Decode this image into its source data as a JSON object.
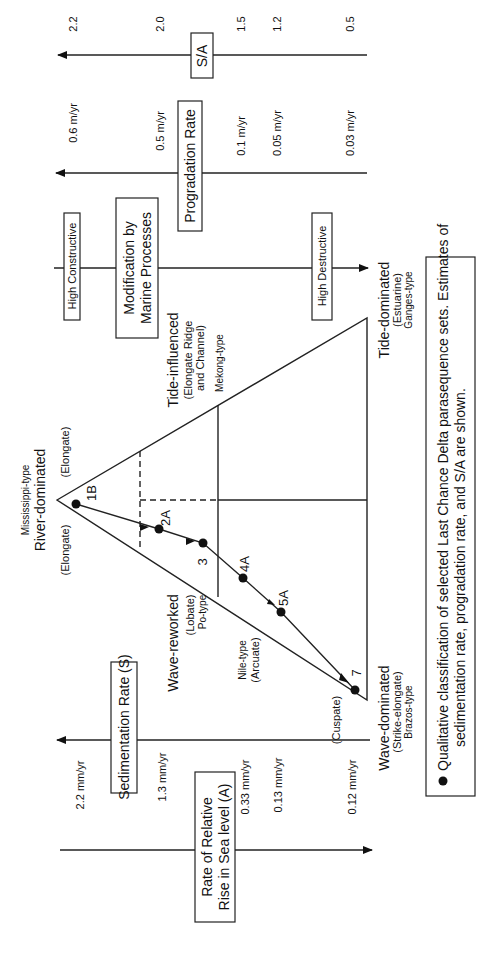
{
  "axes": {
    "sa": {
      "label": "S/A",
      "ticks": [
        "2.2",
        "2.0",
        "1.5",
        "1.2",
        "0.5"
      ]
    },
    "progradation": {
      "label": "Progradation Rate",
      "ticks": [
        "0.6 m/yr",
        "0.5 m/yr",
        "0.1 m/yr",
        "0.05 m/yr",
        "0.03 m/yr"
      ]
    },
    "marine": {
      "label_line1": "Modification by",
      "label_line2": "Marine Processes",
      "left_end": "High Constructive",
      "right_end": "High Destructive"
    },
    "sedimentation": {
      "label": "Sedimentation Rate (S)",
      "ticks": [
        "2.2 mm/yr",
        "1.3 mm/yr",
        "0.33 mm/yr",
        "0.13 mm/yr",
        "0.12 mm/yr"
      ]
    },
    "sealevel": {
      "label_line1": "Rate of Relative",
      "label_line2": "Rise in Sea level (A)"
    }
  },
  "triangle": {
    "river": {
      "type": "Mississippi-type",
      "name": "River-dominated",
      "left": "(Elongate)",
      "right": "(Elongate)"
    },
    "tide_influenced": {
      "name": "Tide-influenced",
      "sub1": "(Elongate Ridge",
      "sub2": "and Channel)",
      "type": "Mekong-type"
    },
    "tide_dominated": {
      "name": "Tide-dominated",
      "sub": "(Estuarine)",
      "type": "Ganges-type"
    },
    "wave_reworked": {
      "name": "Wave-reworked",
      "sub": "(Lobate)",
      "type": "Po-type"
    },
    "nile": {
      "type": "Nile-type",
      "sub": "(Arcuate)"
    },
    "cuspate": "(Cuspate)",
    "wave_dominated": {
      "name": "Wave-dominated",
      "sub": "(Strike-elongate)",
      "type": "Brazos-type"
    }
  },
  "points": [
    {
      "label": "1B"
    },
    {
      "label": "2A"
    },
    {
      "label": "3"
    },
    {
      "label": "4A"
    },
    {
      "label": "5A"
    },
    {
      "label": "7"
    }
  ],
  "legend": {
    "bullet": "●",
    "line1": "Qualitative classification of selected Last Chance Delta parasequence sets.  Estimates of",
    "line2": "sedimentation rate, progradation rate, and S/A are shown."
  }
}
